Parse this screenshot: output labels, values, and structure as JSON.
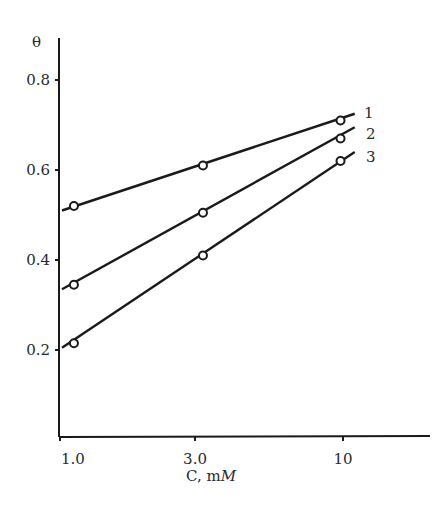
{
  "chart_data": {
    "type": "line",
    "title": "",
    "xlabel": "C, mM",
    "xlabel_parts": {
      "main": "C,  m",
      "italic": "M"
    },
    "ylabel": "θ",
    "xscale": "log",
    "xlim": [
      1.0,
      14.0
    ],
    "ylim": [
      0.0,
      0.9
    ],
    "x_ticks": [
      {
        "value": 1.0,
        "label": "1.0"
      },
      {
        "value": 3.0,
        "label": "3.0"
      },
      {
        "value": 10,
        "label": "10"
      }
    ],
    "y_ticks": [
      {
        "value": 0.2,
        "label": "0.2"
      },
      {
        "value": 0.4,
        "label": "0.4"
      },
      {
        "value": 0.6,
        "label": "0.6"
      },
      {
        "value": 0.8,
        "label": "0.8"
      }
    ],
    "grid": false,
    "legend": "inline labels at right end of lines",
    "series": [
      {
        "name": "1",
        "x": [
          1.12,
          3.2,
          9.8
        ],
        "values": [
          0.52,
          0.61,
          0.71
        ],
        "line_start": [
          1.0,
          0.51
        ],
        "line_end": [
          11.0,
          0.725
        ]
      },
      {
        "name": "2",
        "x": [
          1.12,
          3.2,
          9.8
        ],
        "values": [
          0.345,
          0.505,
          0.67
        ],
        "line_start": [
          1.0,
          0.335
        ],
        "line_end": [
          11.0,
          0.695
        ]
      },
      {
        "name": "3",
        "x": [
          1.12,
          3.2,
          9.8
        ],
        "values": [
          0.215,
          0.41,
          0.62
        ],
        "line_start": [
          1.0,
          0.205
        ],
        "line_end": [
          11.0,
          0.64
        ]
      }
    ],
    "colors": {
      "ink": "#1a1a1a",
      "background": "#ffffff"
    }
  }
}
